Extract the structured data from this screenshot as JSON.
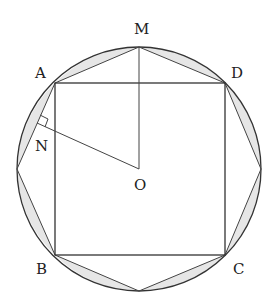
{
  "diagram": {
    "type": "geometry",
    "circle": {
      "center": "O",
      "cx": 139,
      "cy": 169,
      "r": 122
    },
    "points": {
      "M": {
        "label": "M",
        "x": 139,
        "y": 47
      },
      "A": {
        "label": "A",
        "x": 55,
        "y": 83
      },
      "D": {
        "label": "D",
        "x": 225,
        "y": 83
      },
      "B": {
        "label": "B",
        "x": 55,
        "y": 255
      },
      "C": {
        "label": "C",
        "x": 225,
        "y": 255
      },
      "N": {
        "label": "N",
        "x": 37,
        "y": 123
      },
      "O": {
        "label": "O",
        "x": 139,
        "y": 169
      }
    },
    "labels": {
      "M": "M",
      "A": "A",
      "D": "D",
      "N": "N",
      "O": "O",
      "B": "B",
      "C": "C"
    },
    "segments": [
      "AB",
      "BC",
      "CD",
      "DA",
      "OM",
      "ON",
      "AM",
      "MD"
    ],
    "octagon_vertices": [
      "M",
      "D",
      "E_right",
      "C",
      "F_bottom",
      "B",
      "G_left",
      "A"
    ],
    "shaded": "circular segments between octagon sides and the circle",
    "right_angle_mark_at": "N"
  }
}
